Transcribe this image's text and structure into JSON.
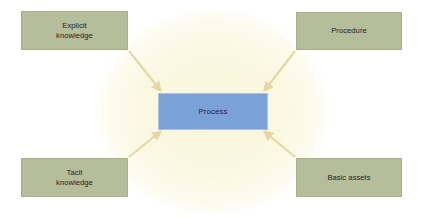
{
  "canvas": {
    "width": 423,
    "height": 218,
    "background_color": "#ffffff"
  },
  "diagram": {
    "type": "convergent-input-diagram",
    "backdrop": {
      "shape": "ellipse",
      "color": "#fbf8e0",
      "edge_color": "#fdfcf2"
    },
    "center_node": {
      "id": "process",
      "label": "Process",
      "fill_color": "#7aa2d9",
      "border_color": "#a9c4e6",
      "text_color": "#1c2340"
    },
    "source_nodes": [
      {
        "id": "explicit-knowledge",
        "label": "Explicit\nknowledge",
        "position": "top-left",
        "fill_color": "#b6bd9a",
        "border_color": "#a8b08a",
        "text_color": "#1d1d28"
      },
      {
        "id": "procedure",
        "label": "Procedure",
        "position": "top-right",
        "fill_color": "#b6bd9a",
        "border_color": "#a8b08a",
        "text_color": "#1d1d28"
      },
      {
        "id": "tacit-knowledge",
        "label": "Tacit\nknowledge",
        "position": "bottom-left",
        "fill_color": "#b6bd9a",
        "border_color": "#a8b08a",
        "text_color": "#1d1d28"
      },
      {
        "id": "basic-assets",
        "label": "Basic assets",
        "position": "bottom-right",
        "fill_color": "#b6bd9a",
        "border_color": "#a8b08a",
        "text_color": "#1d1d28"
      }
    ],
    "connectors": [
      {
        "id": "arrow-explicit-to-process",
        "from": "explicit-knowledge",
        "to": "process",
        "direction": "down-right",
        "color": "#e6d7a1"
      },
      {
        "id": "arrow-procedure-to-process",
        "from": "procedure",
        "to": "process",
        "direction": "down-left",
        "color": "#e6d7a1"
      },
      {
        "id": "arrow-tacit-to-process",
        "from": "tacit-knowledge",
        "to": "process",
        "direction": "up-right",
        "color": "#e6d7a1"
      },
      {
        "id": "arrow-basic-assets-to-process",
        "from": "basic-assets",
        "to": "process",
        "direction": "up-left",
        "color": "#e6d7a1"
      }
    ]
  }
}
